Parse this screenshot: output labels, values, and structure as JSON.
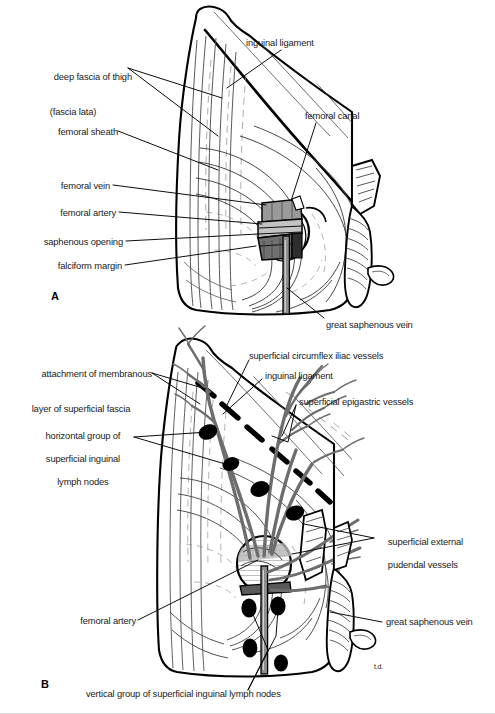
{
  "figure": {
    "panels": [
      {
        "id": "A",
        "letter": "A",
        "caption": "deep fascia of thigh, femoral sheath and saphenous opening"
      },
      {
        "id": "B",
        "letter": "B",
        "caption": "superficial inguinal vessels and lymph nodes"
      }
    ],
    "signature": "t.d."
  },
  "panelA": {
    "letter": "A",
    "labels": {
      "deep_fascia_line1": "deep fascia of thigh",
      "deep_fascia_line2": "(fascia lata)",
      "femoral_sheath": "femoral sheath",
      "femoral_vein": "femoral vein",
      "femoral_artery": "femoral artery",
      "saphenous_opening": "saphenous opening",
      "falciform_margin": "falciform margin",
      "inguinal_ligament": "inguinal ligament",
      "femoral_canal": "femoral canal",
      "great_saphenous_vein": "great saphenous vein"
    }
  },
  "panelB": {
    "letter": "B",
    "labels": {
      "attachment_line1": "attachment of membranous",
      "attachment_line2": "layer of superficial fascia",
      "horizontal_group_line1": "horizontal group of",
      "horizontal_group_line2": "superficial inguinal",
      "horizontal_group_line3": "lymph nodes",
      "femoral_artery": "femoral artery",
      "superficial_circumflex": "superficial circumflex iliac vessels",
      "inguinal_ligament": "inguinal ligament",
      "superficial_epigastric": "superficial epigastric vessels",
      "pudendal_line1": "superficial external",
      "pudendal_line2": "pudendal vessels",
      "great_saphenous_vein": "great saphenous vein",
      "vertical_group": "vertical group of superficial inguinal lymph nodes"
    }
  },
  "colors": {
    "ink": "#000000",
    "text": "#1a1a1a",
    "vessel_grey": "#6e6e6e",
    "vessel_grey_dark": "#4a4a4a",
    "shade_light": "#b9b9b9",
    "shade_mid": "#8c8c8c",
    "shade_dark": "#3c3c3c",
    "paper": "#ffffff",
    "hatch": "#555555"
  }
}
